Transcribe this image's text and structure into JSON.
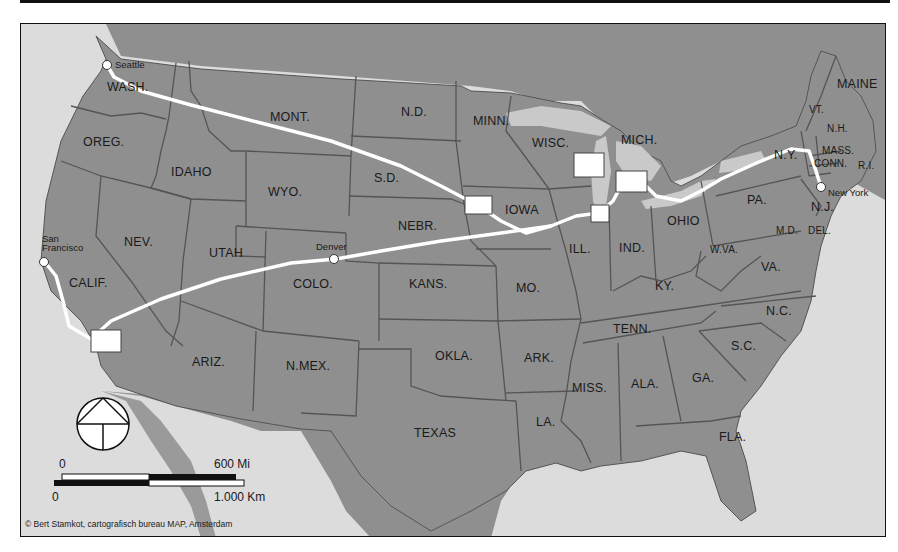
{
  "map": {
    "type": "US railroad route map",
    "colors": {
      "land": "#8f8f8f",
      "water": "#dcdcdc",
      "lakes": "#c9c9c9",
      "borders": "#555555",
      "route": "#ffffff",
      "frame": "#111111"
    },
    "states": [
      {
        "id": "wash",
        "label": "WASH."
      },
      {
        "id": "oreg",
        "label": "OREG."
      },
      {
        "id": "calif",
        "label": "CALIF."
      },
      {
        "id": "idaho",
        "label": "IDAHO"
      },
      {
        "id": "nev",
        "label": "NEV."
      },
      {
        "id": "mont",
        "label": "MONT."
      },
      {
        "id": "wyo",
        "label": "WYO."
      },
      {
        "id": "utah",
        "label": "UTAH"
      },
      {
        "id": "ariz",
        "label": "ARIZ."
      },
      {
        "id": "colo",
        "label": "COLO."
      },
      {
        "id": "nmex",
        "label": "N.MEX."
      },
      {
        "id": "nd",
        "label": "N.D."
      },
      {
        "id": "sd",
        "label": "S.D."
      },
      {
        "id": "nebr",
        "label": "NEBR."
      },
      {
        "id": "kans",
        "label": "KANS."
      },
      {
        "id": "okla",
        "label": "OKLA."
      },
      {
        "id": "texas",
        "label": "TEXAS"
      },
      {
        "id": "minn",
        "label": "MINN."
      },
      {
        "id": "iowa",
        "label": "IOWA"
      },
      {
        "id": "mo",
        "label": "MO."
      },
      {
        "id": "ark",
        "label": "ARK."
      },
      {
        "id": "la",
        "label": "LA."
      },
      {
        "id": "wisc",
        "label": "WISC."
      },
      {
        "id": "ill",
        "label": "ILL."
      },
      {
        "id": "mich",
        "label": "MICH."
      },
      {
        "id": "ind",
        "label": "IND."
      },
      {
        "id": "ohio",
        "label": "OHIO"
      },
      {
        "id": "ky",
        "label": "KY."
      },
      {
        "id": "tenn",
        "label": "TENN."
      },
      {
        "id": "miss",
        "label": "MISS."
      },
      {
        "id": "ala",
        "label": "ALA."
      },
      {
        "id": "ga",
        "label": "GA."
      },
      {
        "id": "fla",
        "label": "FLA."
      },
      {
        "id": "sc",
        "label": "S.C."
      },
      {
        "id": "nc",
        "label": "N.C."
      },
      {
        "id": "va",
        "label": "VA."
      },
      {
        "id": "wva",
        "label": "W.VA."
      },
      {
        "id": "pa",
        "label": "PA."
      },
      {
        "id": "ny",
        "label": "N.Y."
      },
      {
        "id": "nj",
        "label": "N.J."
      },
      {
        "id": "md",
        "label": "M.D."
      },
      {
        "id": "del",
        "label": "DEL."
      },
      {
        "id": "conn",
        "label": "CONN."
      },
      {
        "id": "ri",
        "label": "R.I."
      },
      {
        "id": "mass",
        "label": "MASS."
      },
      {
        "id": "vt",
        "label": "VT."
      },
      {
        "id": "nh",
        "label": "N.H."
      },
      {
        "id": "maine",
        "label": "MAINE"
      }
    ],
    "cities": [
      {
        "id": "seattle",
        "label": "Seattle"
      },
      {
        "id": "sanfrancisco",
        "label_line1": "San",
        "label_line2": "Francisco"
      },
      {
        "id": "denver",
        "label": "Denver"
      },
      {
        "id": "newyork",
        "label": "New York"
      }
    ],
    "scale_bar": {
      "miles_start": "0",
      "miles_end": "600 Mi",
      "km_start": "0",
      "km_end": "1.000 Km"
    },
    "compass": "north-arrow",
    "credit": "© Bert Stamkot, cartografisch bureau MAP, Amsterdam"
  }
}
